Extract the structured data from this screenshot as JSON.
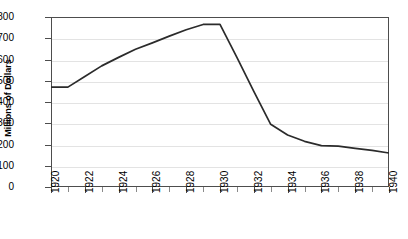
{
  "chart_data": {
    "type": "line",
    "title": "",
    "xlabel": "",
    "ylabel": "Millions of Dollars",
    "xlim": [
      1920,
      1940
    ],
    "ylim": [
      0,
      800
    ],
    "grid": true,
    "legend": "none",
    "y_ticks": [
      0,
      100,
      200,
      300,
      400,
      500,
      600,
      700,
      800
    ],
    "y_tick_labels": [
      "0",
      "100",
      "200",
      "300",
      "400",
      "500",
      "600",
      "700",
      "800"
    ],
    "x_ticks": [
      1920,
      1922,
      1924,
      1926,
      1928,
      1930,
      1932,
      1934,
      1936,
      1938,
      1940
    ],
    "x_tick_labels": [
      "1920",
      "1922",
      "1924",
      "1926",
      "1928",
      "1930",
      "1932",
      "1934",
      "1936",
      "1938",
      "1940"
    ],
    "x_minor_ticks": [
      1921,
      1923,
      1925,
      1927,
      1929,
      1931,
      1933,
      1935,
      1937,
      1939
    ],
    "line_color": "#2b2b2b",
    "grid_color": "#e3e3e3",
    "axis_color": "#4d4d4d",
    "series": [
      {
        "name": "value",
        "x": [
          1920,
          1921,
          1922,
          1923,
          1924,
          1925,
          1926,
          1927,
          1928,
          1929,
          1930,
          1931,
          1932,
          1933,
          1934,
          1935,
          1936,
          1937,
          1938,
          1939,
          1940
        ],
        "values": [
          470,
          470,
          520,
          570,
          610,
          648,
          678,
          710,
          740,
          765,
          765,
          610,
          450,
          295,
          245,
          215,
          195,
          192,
          182,
          172,
          160
        ]
      }
    ]
  }
}
